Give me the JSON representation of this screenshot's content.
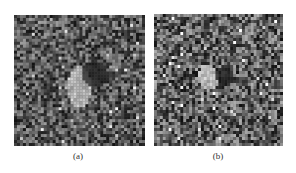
{
  "figure": {
    "panels": [
      {
        "id": "a",
        "caption": "(a)",
        "box": {
          "x": 14,
          "y": 15,
          "w": 131,
          "h": 131
        },
        "caption_pos": {
          "x": 63,
          "y": 151
        },
        "seed": 17,
        "base_gray": 88,
        "noise_amp": 70,
        "bright_blob": {
          "cx": 0.5,
          "cy": 0.55,
          "rx": 0.09,
          "ry": 0.16,
          "gray": 225
        },
        "dark_blob": {
          "cx": 0.62,
          "cy": 0.45,
          "rx": 0.1,
          "ry": 0.1,
          "gray": 25
        },
        "dark_streak": {
          "x0": 0.58,
          "x1": 0.78,
          "cy": 0.47,
          "h": 0.06,
          "gray": 35
        }
      },
      {
        "id": "b",
        "caption": "(b)",
        "box": {
          "x": 154,
          "y": 14,
          "w": 129,
          "h": 132
        },
        "caption_pos": {
          "x": 203,
          "y": 151
        },
        "seed": 41,
        "base_gray": 95,
        "noise_amp": 80,
        "bright_blob": {
          "cx": 0.42,
          "cy": 0.48,
          "rx": 0.08,
          "ry": 0.1,
          "gray": 220
        },
        "dark_blob": {
          "cx": 0.55,
          "cy": 0.47,
          "rx": 0.07,
          "ry": 0.08,
          "gray": 20
        },
        "dark_streak": {
          "x0": 0.52,
          "x1": 0.72,
          "cy": 0.5,
          "h": 0.05,
          "gray": 30
        }
      }
    ]
  },
  "colors": {
    "background": "#ffffff",
    "caption_text": "#333333"
  }
}
